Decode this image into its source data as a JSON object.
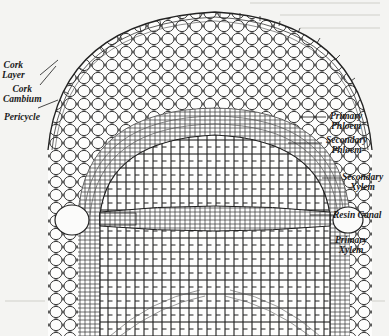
{
  "figure": {
    "colors": {
      "background": "#f4f4f2",
      "ink": "#1a1a1a",
      "cell_fill": "#fbfbfa"
    }
  },
  "labels": {
    "left": [
      {
        "id": "cork-layer",
        "line1": "Cork",
        "line2": "Layer"
      },
      {
        "id": "cork-cambium",
        "line1": "Cork",
        "line2": "Cambium"
      },
      {
        "id": "pericycle",
        "line1": "Pericycle",
        "line2": ""
      }
    ],
    "right": [
      {
        "id": "primary-phloem",
        "line1": "Primary",
        "line2": "Phloem"
      },
      {
        "id": "secondary-phloem",
        "line1": "Secondary",
        "line2": "Phloem"
      },
      {
        "id": "secondary-xylem",
        "line1": "Secondary",
        "line2": "Xylem"
      },
      {
        "id": "resin-canal",
        "line1": "Resin Canal",
        "line2": ""
      },
      {
        "id": "primary-xylem",
        "line1": "Primary",
        "line2": "Xylem"
      }
    ]
  }
}
